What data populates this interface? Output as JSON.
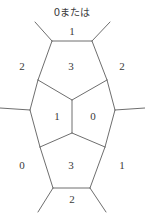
{
  "figure": {
    "title_note": "0または",
    "note_position": {
      "x": 72,
      "y": 12
    },
    "background_color": "#ffffff",
    "line_color": "#6e6e6e",
    "text_color": "#3a3a3a",
    "width": 145,
    "height": 215,
    "region_labels": [
      {
        "id": "top-outer",
        "value": "1",
        "x": 72,
        "y": 31
      },
      {
        "id": "upper-left",
        "value": "2",
        "x": 22,
        "y": 66
      },
      {
        "id": "upper-middle",
        "value": "3",
        "x": 71,
        "y": 66
      },
      {
        "id": "upper-right",
        "value": "2",
        "x": 122,
        "y": 66
      },
      {
        "id": "center-left",
        "value": "1",
        "x": 57,
        "y": 116
      },
      {
        "id": "center-right",
        "value": "0",
        "x": 93,
        "y": 116
      },
      {
        "id": "lower-left",
        "value": "0",
        "x": 22,
        "y": 165
      },
      {
        "id": "lower-middle",
        "value": "3",
        "x": 71,
        "y": 165
      },
      {
        "id": "lower-right",
        "value": "1",
        "x": 122,
        "y": 165
      },
      {
        "id": "bottom-outer",
        "value": "2",
        "x": 72,
        "y": 199
      }
    ],
    "vertices": {
      "top_left": {
        "x": 52,
        "y": 41
      },
      "top_right": {
        "x": 92,
        "y": 41
      },
      "upper_left_junction": {
        "x": 38,
        "y": 80
      },
      "upper_right_junction": {
        "x": 107,
        "y": 80
      },
      "center_upper": {
        "x": 72,
        "y": 100
      },
      "left_junction": {
        "x": 30,
        "y": 110
      },
      "right_junction": {
        "x": 115,
        "y": 110
      },
      "center_lower": {
        "x": 72,
        "y": 133
      },
      "lower_left_junction": {
        "x": 40,
        "y": 147
      },
      "lower_right_junction": {
        "x": 105,
        "y": 147
      },
      "bottom_left": {
        "x": 53,
        "y": 188
      },
      "bottom_right": {
        "x": 90,
        "y": 188
      }
    },
    "edges": [
      {
        "id": "top-horizontal",
        "d": "M52,41 L92,41"
      },
      {
        "id": "top-left-stub",
        "d": "M52,41 L35,22"
      },
      {
        "id": "top-right-stub",
        "d": "M92,41 L110,22"
      },
      {
        "id": "upper-left-slant",
        "d": "M52,41 L38,80"
      },
      {
        "id": "upper-right-slant",
        "d": "M92,41 L107,80"
      },
      {
        "id": "mid-left-inner",
        "d": "M38,80 L72,100"
      },
      {
        "id": "mid-right-inner",
        "d": "M107,80 L72,100"
      },
      {
        "id": "upper-left-outer",
        "d": "M38,80 L30,110"
      },
      {
        "id": "upper-right-outer",
        "d": "M107,80 L115,110"
      },
      {
        "id": "left-horizontal-stub",
        "d": "M30,110 L0,108"
      },
      {
        "id": "right-horizontal-stub",
        "d": "M115,110 L145,108"
      },
      {
        "id": "center-vertical",
        "d": "M72,100 L72,133"
      },
      {
        "id": "lower-left-outer",
        "d": "M30,110 L40,147"
      },
      {
        "id": "lower-right-outer",
        "d": "M115,110 L105,147"
      },
      {
        "id": "low-left-inner",
        "d": "M72,133 L40,147"
      },
      {
        "id": "low-right-inner",
        "d": "M72,133 L105,147"
      },
      {
        "id": "bottom-left-slant",
        "d": "M40,147 L53,188"
      },
      {
        "id": "bottom-right-slant",
        "d": "M105,147 L90,188"
      },
      {
        "id": "bottom-horizontal",
        "d": "M53,188 L90,188"
      },
      {
        "id": "bottom-left-stub",
        "d": "M53,188 L38,212"
      },
      {
        "id": "bottom-right-stub",
        "d": "M90,188 L106,212"
      }
    ]
  }
}
